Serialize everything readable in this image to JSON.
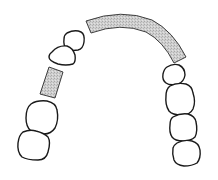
{
  "diagram": {
    "title": "Dental arch chart",
    "colors": {
      "outline": "#1a1a1a",
      "shaded_fill": "#c8c8c8",
      "background": "#ffffff"
    },
    "elements": [
      {
        "id": "left-tooth-lower",
        "type": "tooth",
        "side": "left"
      },
      {
        "id": "left-tooth-upper",
        "type": "tooth",
        "side": "left"
      },
      {
        "id": "left-shaded-segment",
        "type": "shaded-region",
        "side": "left"
      },
      {
        "id": "left-tooth-canine",
        "type": "tooth",
        "side": "left"
      },
      {
        "id": "left-tooth-incisor",
        "type": "tooth",
        "side": "left"
      },
      {
        "id": "anterior-shaded-arch",
        "type": "shaded-region",
        "side": "front"
      },
      {
        "id": "right-tooth-1",
        "type": "tooth",
        "side": "right"
      },
      {
        "id": "right-tooth-2",
        "type": "tooth",
        "side": "right"
      },
      {
        "id": "right-tooth-3",
        "type": "tooth",
        "side": "right"
      },
      {
        "id": "right-tooth-4",
        "type": "tooth",
        "side": "right"
      }
    ]
  }
}
